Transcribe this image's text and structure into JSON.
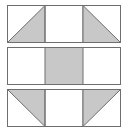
{
  "diagram": {
    "title": "",
    "colors": {
      "fill": "#c8c8c8",
      "stroke": "#6e6e6e",
      "background": "#ffffff"
    },
    "rows": [
      {
        "id": "row-top",
        "cells": [
          "triangle-bottom-right",
          "blank",
          "triangle-bottom-left"
        ]
      },
      {
        "id": "row-middle",
        "cells": [
          "blank",
          "filled",
          "blank"
        ]
      },
      {
        "id": "row-bottom",
        "cells": [
          "triangle-top-right",
          "blank",
          "triangle-top-left"
        ]
      }
    ]
  }
}
